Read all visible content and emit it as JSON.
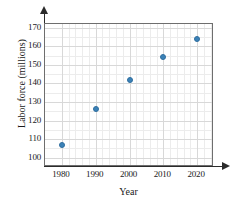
{
  "chart_data": {
    "type": "scatter",
    "title": "",
    "xlabel": "Year",
    "ylabel": "Labor force (millions)",
    "x": [
      1980,
      1990,
      2000,
      2010,
      2020
    ],
    "values": [
      107,
      126,
      142,
      154,
      164
    ],
    "series": [
      {
        "name": "Labor force",
        "points": [
          {
            "x": 1980,
            "y": 107
          },
          {
            "x": 1990,
            "y": 126
          },
          {
            "x": 2000,
            "y": 142
          },
          {
            "x": 2010,
            "y": 154
          },
          {
            "x": 2020,
            "y": 164
          }
        ]
      }
    ],
    "xlim": [
      1975,
      2025
    ],
    "ylim": [
      95,
      172
    ],
    "xticks": [
      "1980",
      "1990",
      "2000",
      "2010",
      "2020"
    ],
    "yticks": [
      "100",
      "110",
      "120",
      "130",
      "140",
      "150",
      "160",
      "170"
    ],
    "grid": true,
    "legend": false,
    "marker_color": "#3b82b8",
    "grid_color": "#d8d8d8",
    "axis_color": "#2b2b2b"
  }
}
